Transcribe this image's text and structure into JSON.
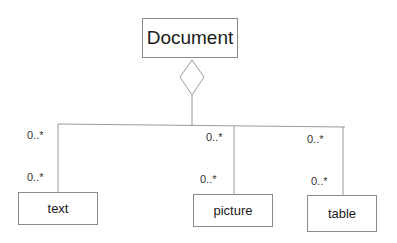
{
  "diagram": {
    "type": "UML class diagram (aggregation)",
    "parent": {
      "label": "Document"
    },
    "children": [
      {
        "label": "text",
        "multiplicity_top": "0..*",
        "multiplicity_bottom": "0..*"
      },
      {
        "label": "picture",
        "multiplicity_top": "0..*",
        "multiplicity_bottom": "0..*"
      },
      {
        "label": "table",
        "multiplicity_top": "0..*",
        "multiplicity_bottom": "0..*"
      }
    ],
    "relationship": "aggregation-diamond",
    "colors": {
      "line": "#9a9a9a",
      "text": "#1a1a1a",
      "background": "#ffffff"
    }
  }
}
